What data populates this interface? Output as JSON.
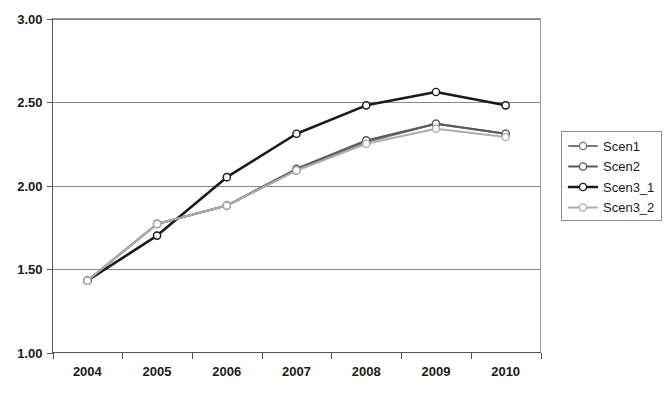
{
  "chart_data": {
    "type": "line",
    "title": "",
    "xlabel": "",
    "ylabel": "",
    "categories": [
      "2004",
      "2005",
      "2006",
      "2007",
      "2008",
      "2009",
      "2010"
    ],
    "ylim": [
      1.0,
      3.0
    ],
    "ytick_labels": [
      "1.00",
      "1.50",
      "2.00",
      "2.50",
      "3.00"
    ],
    "ytick_values": [
      1.0,
      1.5,
      2.0,
      2.5,
      3.0
    ],
    "grid": true,
    "grid_axis": "y",
    "legend_position": "right",
    "series": [
      {
        "name": "Scen1",
        "color": "#7a7a7a",
        "width": 2.0,
        "marker": "open-circle",
        "values": [
          1.43,
          1.77,
          1.88,
          2.09,
          2.26,
          2.37,
          2.31
        ]
      },
      {
        "name": "Scen2",
        "color": "#595959",
        "width": 2.0,
        "marker": "open-circle",
        "values": [
          1.43,
          1.77,
          1.88,
          2.1,
          2.27,
          2.37,
          2.31
        ]
      },
      {
        "name": "Scen3_1",
        "color": "#1a1a1a",
        "width": 2.6,
        "marker": "open-circle",
        "values": [
          1.43,
          1.7,
          2.05,
          2.31,
          2.48,
          2.56,
          2.48
        ]
      },
      {
        "name": "Scen3_2",
        "color": "#adadad",
        "width": 2.0,
        "marker": "open-circle",
        "values": [
          1.43,
          1.77,
          1.88,
          2.09,
          2.25,
          2.34,
          2.29
        ]
      }
    ]
  },
  "legend": {
    "entries": [
      {
        "label": "Scen1"
      },
      {
        "label": "Scen2"
      },
      {
        "label": "Scen3_1"
      },
      {
        "label": "Scen3_2"
      }
    ]
  },
  "colors": {
    "background": "#ffffff",
    "gridline": "#888888",
    "axis": "#555555",
    "text": "#1a1a1a"
  }
}
